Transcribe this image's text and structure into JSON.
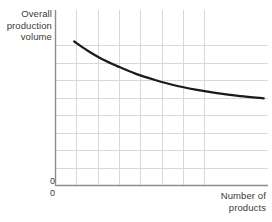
{
  "chart_data": {
    "type": "line",
    "title": "",
    "subtitle": "",
    "ylabel": "Overall\nproduction\nvolume",
    "xlabel": "Number of\nproducts",
    "y_origin_label": "0",
    "x_origin_label": "0",
    "grid": true,
    "grid_color": "#d8d8d8",
    "axis_color": "#8c8c8c",
    "line_color": "#1a1a1a",
    "line_width": 2.2,
    "legend": [],
    "annotations": [],
    "xlim": [
      0,
      10
    ],
    "ylim": [
      0,
      10
    ],
    "x_tick_labels": [],
    "y_tick_labels": [],
    "x_gridline_values": [
      1,
      2,
      3,
      4,
      5,
      6,
      7
    ],
    "y_gridline_values": [
      1,
      2,
      3,
      4,
      5,
      6,
      7,
      8
    ],
    "series": [
      {
        "name": "Overall production volume",
        "x": [
          0.9,
          1.5,
          2.2,
          3.0,
          3.8,
          4.7,
          5.6,
          6.6,
          7.6,
          8.7,
          9.8
        ],
        "values": [
          8.2,
          7.7,
          7.2,
          6.75,
          6.35,
          6.0,
          5.7,
          5.45,
          5.25,
          5.08,
          4.95
        ]
      }
    ]
  },
  "figure": {
    "background": "#ffffff",
    "plot_left": 55,
    "plot_right": 268,
    "plot_top": 10,
    "plot_bottom": 185
  }
}
